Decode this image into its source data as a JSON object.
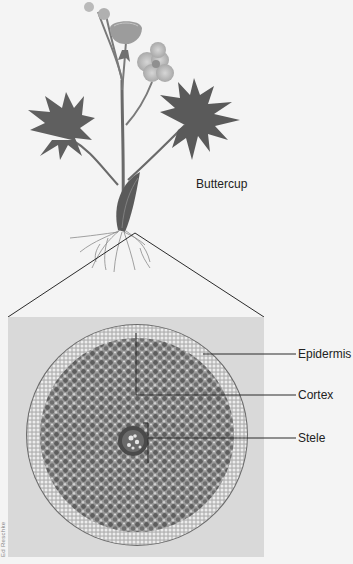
{
  "figure": {
    "plant_label": "Buttercup",
    "photo_credit": "Ed Reschke",
    "labels": [
      {
        "id": "epidermis",
        "text": "Epidermis"
      },
      {
        "id": "cortex",
        "text": "Cortex"
      },
      {
        "id": "stele",
        "text": "Stele"
      }
    ],
    "colors": {
      "background": "#f4f4f4",
      "photo_frame": "#d9d9d9",
      "leader_line": "#2a2a2a",
      "plant_dark": "#5a5a5a",
      "flower": "#c8c8c8"
    }
  }
}
